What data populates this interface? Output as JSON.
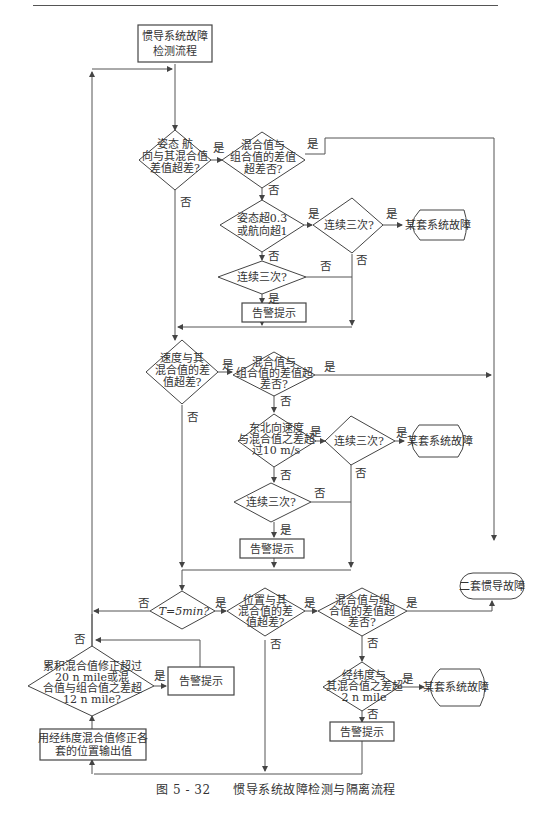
{
  "title": "惯导系统故障检测与隔离流程",
  "caption": {
    "figure_number": "图 5 - 32",
    "text": "惯导系统故障检测与隔离流程"
  },
  "nodes": {
    "start": [
      "惯导系统故障",
      "检测流程"
    ],
    "d_attitude": [
      "姿态 航",
      "向与其混合值",
      "差值超差?"
    ],
    "d_mix1": [
      "混合值与",
      "组合值的差值",
      "超差否?"
    ],
    "d_att_thresh": [
      "姿态超0.3",
      "或航向超1"
    ],
    "d_consec1a": [
      "连续三次?"
    ],
    "fault1": [
      "某套系统故障"
    ],
    "d_consec1b": [
      "连续三次?"
    ],
    "alarm1": [
      "告警提示"
    ],
    "d_velocity": [
      "速度与其",
      "混合值的差",
      "值超差?"
    ],
    "d_mix2": [
      "混合值与",
      "组合值的差值超",
      "差否?"
    ],
    "d_vel_thresh": [
      "东北向速度",
      "与混合值之差超",
      "过10 m/s"
    ],
    "d_consec2a": [
      "连续三次?"
    ],
    "fault2": [
      "某套系统故障"
    ],
    "d_consec2b": [
      "连续三次?"
    ],
    "alarm2": [
      "告警提示"
    ],
    "dual_fault": [
      "二套惯导故障"
    ],
    "d_time": [
      "T=5min?"
    ],
    "d_position": [
      "位置与其",
      "混合值的差",
      "值超差?"
    ],
    "d_mix3": [
      "混合值与组",
      "合值的差值超",
      "差否?"
    ],
    "d_pos_thresh": [
      "经纬度与",
      "其混合值之差超",
      "2 n mile"
    ],
    "fault3": [
      "某套系统故障"
    ],
    "alarm3": [
      "告警提示"
    ],
    "d_cumulative": [
      "累积混合值修正超过",
      "20 n mile或混",
      "合值与组合值之差超",
      "12 n mile?"
    ],
    "alarm4": [
      "告警提示"
    ],
    "correct": [
      "用经纬度混合值修正各",
      "套的位置输出值"
    ]
  },
  "labels": {
    "yes": "是",
    "no": "否"
  },
  "colors": {
    "line": "#555555",
    "text": "#333333",
    "background": "#ffffff"
  }
}
